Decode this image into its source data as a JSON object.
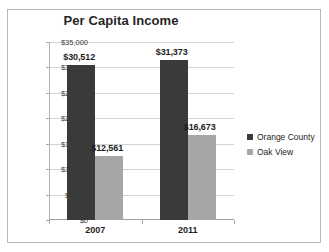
{
  "chart_data": {
    "type": "bar",
    "title": "Per Capita Income",
    "xlabel": "",
    "ylabel": "",
    "categories": [
      "2007",
      "2011"
    ],
    "series": [
      {
        "name": "Orange County",
        "color": "#3a3a3a",
        "values": [
          30512,
          31373
        ],
        "labels": [
          "$30,512",
          "$31,373"
        ]
      },
      {
        "name": "Oak View",
        "color": "#a6a6a6",
        "values": [
          12561,
          16673
        ],
        "labels": [
          "$12,561",
          "$16,673"
        ]
      }
    ],
    "ylim": [
      0,
      35000
    ],
    "ytick_values": [
      0,
      5000,
      10000,
      15000,
      20000,
      25000,
      30000,
      35000
    ],
    "ytick_labels": [
      "$0",
      "$5,000",
      "$10,000",
      "$15,000",
      "$20,000",
      "$25,000",
      "$30,000",
      "$35,000"
    ],
    "grid": true,
    "legend_position": "right"
  },
  "legend": {
    "items": [
      {
        "label": "Orange County",
        "color": "#3a3a3a"
      },
      {
        "label": "Oak View",
        "color": "#a6a6a6"
      }
    ]
  }
}
